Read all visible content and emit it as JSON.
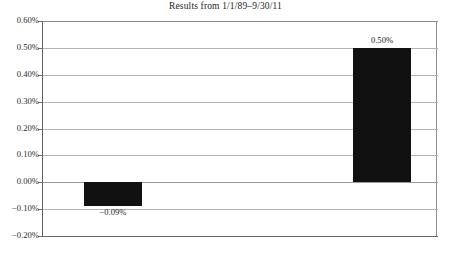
{
  "chart_data": {
    "type": "bar",
    "title": "Results from 1/1/89–9/30/11",
    "xlabel": "",
    "ylabel": "",
    "categories": [
      "",
      ""
    ],
    "values": [
      -0.09,
      0.5
    ],
    "data_labels": [
      "−0.09%",
      "0.50%"
    ],
    "ylim": [
      -0.2,
      0.6
    ],
    "ytick_values": [
      0.6,
      0.5,
      0.4,
      0.3,
      0.2,
      0.1,
      0.0,
      -0.1,
      -0.2
    ],
    "ytick_labels": [
      "0.60%",
      "0.50%",
      "0.40%",
      "0.30%",
      "0.20%",
      "0.10%",
      "0.00%",
      "−0.10%",
      "−0.20%"
    ],
    "grid": true,
    "grid_axis": "y",
    "legend": false,
    "bar_color": "#111111",
    "gridline_color": "#b4b4b4",
    "axis_color": "#6a6a6a"
  },
  "artifact": {
    "bottom_sliver": ""
  }
}
